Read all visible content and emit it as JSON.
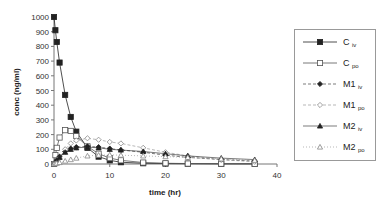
{
  "chart_data": {
    "type": "line",
    "title": "",
    "xlabel": "time (hr)",
    "ylabel": "conc (ng/ml)",
    "xlim": [
      0,
      40
    ],
    "ylim": [
      0,
      1000
    ],
    "xticks": [
      0,
      10,
      20,
      30,
      40
    ],
    "yticks": [
      0,
      100,
      200,
      300,
      400,
      500,
      600,
      700,
      800,
      900,
      1000
    ],
    "grid": false,
    "legend_position": "right",
    "series": [
      {
        "name": "C iv",
        "base": "C",
        "sub": "iv",
        "marker": "square-filled",
        "line": "solid",
        "color": "#222222",
        "x": [
          0,
          0.25,
          0.5,
          1,
          2,
          3,
          4,
          6,
          8,
          10,
          12,
          16,
          20,
          24,
          30,
          36
        ],
        "y": [
          1000,
          910,
          830,
          690,
          470,
          320,
          220,
          110,
          50,
          25,
          12,
          5,
          3,
          2,
          1,
          1
        ]
      },
      {
        "name": "C po",
        "base": "C",
        "sub": "po",
        "marker": "square-open",
        "line": "solid",
        "color": "#555555",
        "x": [
          0,
          0.25,
          0.5,
          1,
          2,
          3,
          4,
          6,
          8,
          10,
          12,
          16,
          20,
          24,
          30,
          36
        ],
        "y": [
          0,
          60,
          110,
          180,
          230,
          225,
          190,
          120,
          70,
          40,
          25,
          10,
          5,
          3,
          2,
          1
        ]
      },
      {
        "name": "M1 iv",
        "base": "M1",
        "sub": "iv",
        "marker": "diamond-filled",
        "line": "dashed",
        "color": "#222222",
        "x": [
          0,
          0.25,
          0.5,
          1,
          2,
          3,
          4,
          6,
          8,
          10,
          12,
          16,
          20,
          24,
          30,
          36
        ],
        "y": [
          0,
          10,
          25,
          50,
          85,
          105,
          115,
          120,
          115,
          105,
          95,
          80,
          60,
          45,
          30,
          20
        ]
      },
      {
        "name": "M1 po",
        "base": "M1",
        "sub": "po",
        "marker": "diamond-open",
        "line": "dashed",
        "color": "#888888",
        "x": [
          0,
          0.25,
          0.5,
          1,
          2,
          3,
          4,
          6,
          8,
          10,
          12,
          16,
          20,
          24,
          30,
          36
        ],
        "y": [
          0,
          5,
          15,
          40,
          100,
          140,
          160,
          175,
          165,
          150,
          140,
          110,
          80,
          55,
          30,
          15
        ]
      },
      {
        "name": "M2 iv",
        "base": "M2",
        "sub": "iv",
        "marker": "triangle-filled",
        "line": "solid-light",
        "color": "#222222",
        "x": [
          0,
          0.25,
          0.5,
          1,
          2,
          3,
          4,
          6,
          8,
          10,
          12,
          16,
          20,
          24,
          30,
          36
        ],
        "y": [
          0,
          8,
          20,
          45,
          80,
          100,
          110,
          115,
          110,
          100,
          95,
          85,
          70,
          55,
          40,
          30
        ]
      },
      {
        "name": "M2 po",
        "base": "M2",
        "sub": "po",
        "marker": "triangle-open",
        "line": "dotted",
        "color": "#888888",
        "x": [
          0,
          0.25,
          0.5,
          1,
          2,
          3,
          4,
          6,
          8,
          10,
          12,
          16,
          20,
          24,
          30,
          36
        ],
        "y": [
          0,
          2,
          5,
          10,
          20,
          30,
          40,
          55,
          60,
          62,
          60,
          55,
          50,
          45,
          35,
          25
        ]
      }
    ]
  }
}
